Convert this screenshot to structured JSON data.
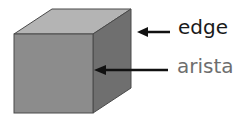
{
  "labels": {
    "edge": "edge",
    "arista": "arista"
  },
  "colors": {
    "front_face": "#8c8c8c",
    "top_face": "#b4b4b4",
    "side_face": "#6f6f6f",
    "outline": "#4a4a4a",
    "arrow": "#111111",
    "edge_text": "#1a1a1a",
    "arista_text": "#6e6e6e"
  }
}
